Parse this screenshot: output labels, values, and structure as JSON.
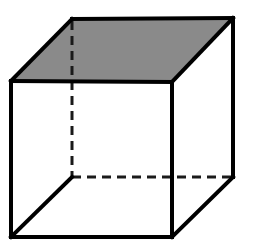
{
  "figure": {
    "name": "wireframe-cube",
    "title": "Cube in oblique projection",
    "canvas": {
      "width": 253,
      "height": 251,
      "background": "#ffffff"
    },
    "style": {
      "face_shaded_color": "#8a8a8a",
      "face_unshaded_color": "#ffffff",
      "edge_color": "#000000",
      "edge_width": 4,
      "hidden_edge_color": "#1a1a1a",
      "hidden_edge_width": 3,
      "hidden_dash_pattern": "9 6"
    },
    "vertices": {
      "front_top_left": {
        "label": "A",
        "x": 11,
        "y": 81,
        "hidden": false
      },
      "front_top_right": {
        "label": "B",
        "x": 172,
        "y": 82,
        "hidden": false
      },
      "front_bottom_right": {
        "label": "C",
        "x": 172,
        "y": 237,
        "hidden": false
      },
      "front_bottom_left": {
        "label": "D",
        "x": 11,
        "y": 237,
        "hidden": false
      },
      "back_top_left": {
        "label": "E",
        "x": 72,
        "y": 19,
        "hidden": false
      },
      "back_top_right": {
        "label": "F",
        "x": 233,
        "y": 18,
        "hidden": false
      },
      "back_bottom_right": {
        "label": "G",
        "x": 233,
        "y": 177,
        "hidden": false
      },
      "back_bottom_left": {
        "label": "H",
        "x": 72,
        "y": 177,
        "hidden": true
      }
    },
    "faces": [
      {
        "name": "top-face",
        "shaded": true,
        "fill": "#8a8a8a",
        "points": "11,81 72,19 233,18 172,82"
      },
      {
        "name": "bottom-face",
        "shaded": true,
        "fill": "#8a8a8a",
        "points": "11,237 172,237 233,177 72,177"
      },
      {
        "name": "front-face",
        "shaded": false,
        "fill": "#ffffff",
        "points": "11,81 172,82 172,237 11,237"
      },
      {
        "name": "right-face",
        "shaded": false,
        "fill": "#ffffff",
        "points": "172,82 233,18 233,177 172,237"
      }
    ],
    "edges_visible": [
      {
        "name": "edge-front-top",
        "from": "front_top_left",
        "to": "front_top_right",
        "d": "M 11,81 L 172,82"
      },
      {
        "name": "edge-front-right",
        "from": "front_top_right",
        "to": "front_bottom_right",
        "d": "M 172,82 L 172,237"
      },
      {
        "name": "edge-front-bottom",
        "from": "front_bottom_right",
        "to": "front_bottom_left",
        "d": "M 172,237 L 11,237"
      },
      {
        "name": "edge-front-left",
        "from": "front_bottom_left",
        "to": "front_top_left",
        "d": "M 11,237 L 11,81"
      },
      {
        "name": "edge-top-left-diagonal",
        "from": "front_top_left",
        "to": "back_top_left",
        "d": "M 11,81 L 72,19"
      },
      {
        "name": "edge-back-top",
        "from": "back_top_left",
        "to": "back_top_right",
        "d": "M 72,19 L 233,18"
      },
      {
        "name": "edge-top-right-diagonal",
        "from": "back_top_right",
        "to": "front_top_right",
        "d": "M 233,18 L 172,82"
      },
      {
        "name": "edge-back-right",
        "from": "back_top_right",
        "to": "back_bottom_right",
        "d": "M 233,18 L 233,177"
      },
      {
        "name": "edge-bottom-right-diagonal",
        "from": "back_bottom_right",
        "to": "front_bottom_right",
        "d": "M 233,177 L 172,237"
      },
      {
        "name": "edge-bottom-left-diagonal",
        "from": "back_bottom_left",
        "to": "front_bottom_left",
        "d": "M 72,177 L 11,237"
      }
    ],
    "edges_hidden": [
      {
        "name": "hidden-edge-vertical",
        "from": "back_top_left",
        "to": "back_bottom_left",
        "d": "M 72,21 L 72,177"
      },
      {
        "name": "hidden-edge-back-bottom",
        "from": "back_bottom_left",
        "to": "back_bottom_right",
        "d": "M 72,177 L 231,177"
      }
    ]
  }
}
